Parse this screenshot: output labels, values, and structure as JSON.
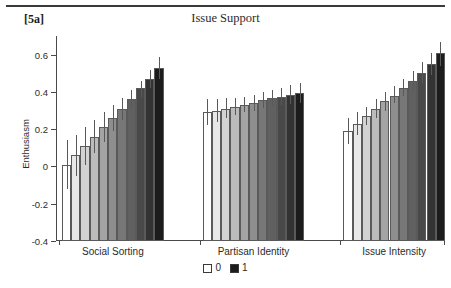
{
  "figure": {
    "panel_label": "[5a]",
    "title": "Issue Support",
    "ylabel": "Enthusiasm"
  },
  "legend": {
    "items": [
      {
        "label": "0",
        "color": "#ffffff"
      },
      {
        "label": "1",
        "color": "#1c1c1c"
      }
    ]
  },
  "chart_data": {
    "type": "bar",
    "title": "Issue Support",
    "xlabel": "",
    "ylabel": "Enthusiasm",
    "ylim": [
      -0.4,
      0.7
    ],
    "yticks": [
      -0.4,
      -0.2,
      0,
      0.2,
      0.4,
      0.6
    ],
    "ytick_labels": [
      "-0.4",
      "-0.2",
      "0",
      "0.2",
      "0.4",
      "0.6"
    ],
    "grid": false,
    "legend_position": "bottom-center",
    "error_bars": "vertical lines, no caps",
    "shading_note": "Within each group the 11 bars shade from white (level 0) to near-black (level 1).",
    "groups": [
      {
        "name": "Social Sorting",
        "levels": [
          "0",
          "0.1",
          "0.2",
          "0.3",
          "0.4",
          "0.5",
          "0.6",
          "0.7",
          "0.8",
          "0.9",
          "1"
        ],
        "values": [
          0.01,
          0.06,
          0.11,
          0.16,
          0.21,
          0.26,
          0.31,
          0.36,
          0.42,
          0.47,
          0.53
        ],
        "err_low": [
          -0.12,
          -0.05,
          0.01,
          0.07,
          0.13,
          0.19,
          0.25,
          0.31,
          0.37,
          0.42,
          0.47
        ],
        "err_high": [
          0.14,
          0.17,
          0.21,
          0.25,
          0.29,
          0.33,
          0.37,
          0.41,
          0.46,
          0.52,
          0.59
        ]
      },
      {
        "name": "Partisan Identity",
        "levels": [
          "0",
          "0.1",
          "0.2",
          "0.3",
          "0.4",
          "0.5",
          "0.6",
          "0.7",
          "0.8",
          "0.9",
          "1"
        ],
        "values": [
          0.29,
          0.3,
          0.31,
          0.32,
          0.33,
          0.34,
          0.355,
          0.365,
          0.375,
          0.385,
          0.395
        ],
        "err_low": [
          0.22,
          0.24,
          0.26,
          0.275,
          0.29,
          0.3,
          0.315,
          0.325,
          0.33,
          0.335,
          0.34
        ],
        "err_high": [
          0.36,
          0.36,
          0.365,
          0.37,
          0.375,
          0.385,
          0.4,
          0.41,
          0.42,
          0.435,
          0.45
        ]
      },
      {
        "name": "Issue Intensity",
        "levels": [
          "0",
          "0.1",
          "0.2",
          "0.3",
          "0.4",
          "0.5",
          "0.6",
          "0.7",
          "0.8",
          "0.9",
          "1"
        ],
        "values": [
          0.19,
          0.23,
          0.27,
          0.31,
          0.35,
          0.38,
          0.42,
          0.46,
          0.5,
          0.55,
          0.61
        ],
        "err_low": [
          0.12,
          0.17,
          0.22,
          0.26,
          0.3,
          0.34,
          0.38,
          0.41,
          0.45,
          0.49,
          0.54
        ],
        "err_high": [
          0.26,
          0.29,
          0.32,
          0.36,
          0.4,
          0.43,
          0.47,
          0.51,
          0.56,
          0.61,
          0.67
        ]
      }
    ]
  }
}
